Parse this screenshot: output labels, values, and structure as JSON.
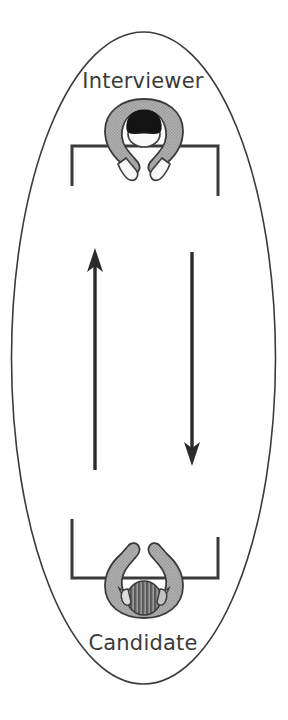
{
  "diagram": {
    "title_absent": "",
    "type": "seating-arrangement-diagram",
    "labels": {
      "interviewer": "Interviewer",
      "candidate": "Candidate"
    },
    "roles": [
      {
        "name": "Interviewer",
        "position": "top",
        "figure": "person-top-down-dark-hair",
        "desk": "desk-open-downward"
      },
      {
        "name": "Candidate",
        "position": "bottom",
        "figure": "person-top-down-hatched-hair",
        "desk": "desk-open-upward"
      }
    ],
    "arrows": [
      {
        "name": "arrow-up",
        "direction": "up",
        "from": "Candidate",
        "to": "Interviewer"
      },
      {
        "name": "arrow-down",
        "direction": "down",
        "from": "Interviewer",
        "to": "Candidate"
      }
    ],
    "colors": {
      "outline": "#3b3b3b",
      "body_gray": "#a9a9a9",
      "hair_dark": "#1a1a1a",
      "face_light": "#f2f2f2",
      "arrow": "#2b2b2b",
      "background": "#ffffff",
      "text": "#3b3b3b"
    }
  }
}
